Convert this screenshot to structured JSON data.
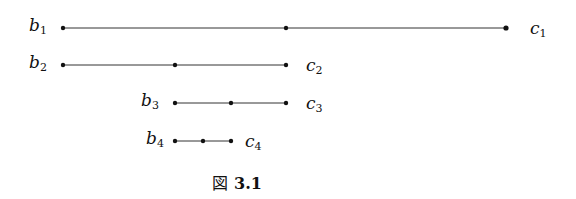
{
  "diagram": {
    "segments": [
      {
        "left": "b",
        "left_sub": "1",
        "right": "c",
        "right_sub": "1",
        "x1": 63,
        "x2": 506,
        "y": 28,
        "points": [
          63,
          286,
          506
        ]
      },
      {
        "left": "b",
        "left_sub": "2",
        "right": "c",
        "right_sub": "2",
        "x1": 63,
        "x2": 286,
        "y": 65,
        "points": [
          63,
          175,
          286
        ]
      },
      {
        "left": "b",
        "left_sub": "3",
        "right": "c",
        "right_sub": "3",
        "x1": 175,
        "x2": 286,
        "y": 103,
        "points": [
          175,
          231,
          286
        ]
      },
      {
        "left": "b",
        "left_sub": "4",
        "right": "c",
        "right_sub": "4",
        "x1": 175,
        "x2": 231,
        "y": 141,
        "points": [
          175,
          203,
          231
        ]
      }
    ],
    "caption": {
      "prefix": "図",
      "number": "3.1"
    }
  }
}
